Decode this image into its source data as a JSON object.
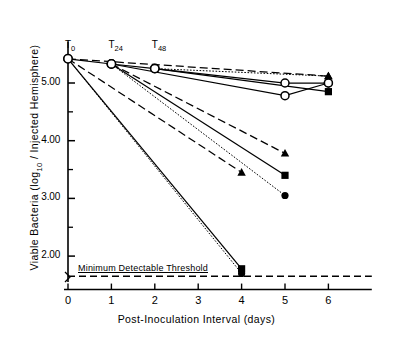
{
  "chart_data": {
    "type": "line",
    "title": "",
    "xlabel": "Post-Inoculation Interval (days)",
    "ylabel": "Viable Bacteria (log10 / Injected Hemisphere)",
    "xlim": [
      0,
      7.0
    ],
    "ylim": [
      1.55,
      5.72
    ],
    "grid": false,
    "legend": "none",
    "xticks": [
      0,
      1,
      2,
      3,
      4,
      5,
      6
    ],
    "xticklabels": [
      "0",
      "1",
      "2",
      "3",
      "4",
      "5",
      "6"
    ],
    "yticks": [
      2.0,
      3.0,
      4.0,
      5.0
    ],
    "yticklabels": [
      "2.00",
      "3.00",
      "4.00",
      "5.00"
    ],
    "yminorticks": [
      2.5,
      3.5,
      4.5
    ],
    "annotations": [
      {
        "name": "T0",
        "text": "T",
        "sub": "0",
        "x": 0,
        "y": 5.62
      },
      {
        "name": "T24",
        "text": "T",
        "sub": "24",
        "x": 1,
        "y": 5.62
      },
      {
        "name": "T48",
        "text": "T",
        "sub": "48",
        "x": 2,
        "y": 5.62
      }
    ],
    "threshold": {
      "label": "Minimum Detectable Threshold",
      "value": 1.65,
      "style": "dashed"
    },
    "series": [
      {
        "name": "T0-control-open-circle",
        "marker": "open-circle",
        "line": "solid",
        "x": [
          0,
          1,
          2,
          5,
          6
        ],
        "y": [
          5.42,
          5.33,
          5.25,
          5.0,
          5.0
        ]
      },
      {
        "name": "T0-dashed-triangle",
        "marker": "filled-triangle",
        "line": "dashed",
        "x": [
          0,
          6
        ],
        "y": [
          5.42,
          5.12
        ]
      },
      {
        "name": "T0-dashed-declining-triangle",
        "marker": "filled-triangle",
        "line": "dashed",
        "x": [
          0,
          4
        ],
        "y": [
          5.42,
          3.45
        ]
      },
      {
        "name": "T0-solid-declining-square",
        "marker": "filled-square",
        "line": "solid",
        "x": [
          0,
          4
        ],
        "y": [
          5.42,
          1.78
        ]
      },
      {
        "name": "T0-dotted-declining-circle",
        "marker": "filled-circle",
        "line": "dotted",
        "x": [
          0,
          4
        ],
        "y": [
          5.42,
          1.7
        ]
      },
      {
        "name": "T24-solid-square",
        "marker": "filled-square",
        "line": "solid",
        "x": [
          1,
          5
        ],
        "y": [
          5.33,
          3.4
        ]
      },
      {
        "name": "T24-dotted-circle",
        "marker": "filled-circle",
        "line": "dotted",
        "x": [
          1,
          5
        ],
        "y": [
          5.33,
          3.05
        ]
      },
      {
        "name": "T24-dashed-triangle",
        "marker": "filled-triangle",
        "line": "dashed",
        "x": [
          1,
          5
        ],
        "y": [
          5.33,
          3.78
        ]
      },
      {
        "name": "T24-solid-open-circle",
        "marker": "open-circle",
        "line": "solid",
        "x": [
          1,
          5,
          6
        ],
        "y": [
          5.33,
          4.78,
          5.0
        ]
      },
      {
        "name": "T48-solid-square",
        "marker": "filled-square",
        "line": "solid",
        "x": [
          2,
          6
        ],
        "y": [
          5.25,
          4.85
        ]
      },
      {
        "name": "T48-dotted-triangle",
        "marker": "filled-triangle",
        "line": "dotted",
        "x": [
          2,
          6
        ],
        "y": [
          5.25,
          5.12
        ]
      }
    ]
  },
  "axes": {
    "y_title": "Viable Bacteria (log",
    "y_title_sub": "10",
    "y_title_tail": " / Injected Hemisphere)",
    "x_title": "Post-Inoculation Interval  (days)"
  },
  "ticks": {
    "y": [
      "5.00",
      "4.00",
      "3.00",
      "2.00"
    ],
    "x": [
      "0",
      "1",
      "2",
      "3",
      "4",
      "5",
      "6"
    ]
  },
  "labels": {
    "t0": "T",
    "t0_sub": "0",
    "t24": "T",
    "t24_sub": "24",
    "t48": "T",
    "t48_sub": "48",
    "threshold": "Minimum Detectable Threshold"
  }
}
